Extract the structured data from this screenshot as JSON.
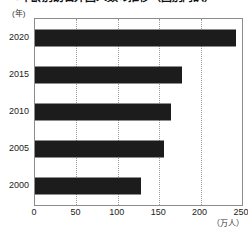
{
  "chart_data": {
    "type": "bar",
    "orientation": "horizontal",
    "title": "●年齢別訪日外国人数の推移（国別内訳）",
    "xlabel": "",
    "ylabel": "",
    "x_unit": "（万人）",
    "y_unit": "(年)",
    "categories": [
      "2020",
      "2015",
      "2010",
      "2005",
      "2000"
    ],
    "values": [
      243,
      177,
      164,
      156,
      128
    ],
    "xticks": [
      "0",
      "50",
      "100",
      "150",
      "200",
      "250"
    ],
    "xtick_values": [
      0,
      50,
      100,
      150,
      200,
      250
    ],
    "xlim": [
      0,
      250
    ],
    "grid": "vertical-dotted",
    "legend": "none",
    "bar_color": "#1c1c1c",
    "grid_color": "#9a9a9a",
    "frame_color": "#8c8c8c"
  }
}
